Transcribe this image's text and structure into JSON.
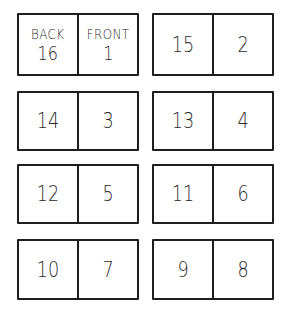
{
  "diagram": {
    "labels": {
      "back": "BACK",
      "front": "FRONT"
    },
    "spreads": [
      {
        "left": "16",
        "right": "1",
        "left_label": "BACK",
        "right_label": "FRONT"
      },
      {
        "left": "15",
        "right": "2"
      },
      {
        "left": "14",
        "right": "3"
      },
      {
        "left": "13",
        "right": "4"
      },
      {
        "left": "12",
        "right": "5"
      },
      {
        "left": "11",
        "right": "6"
      },
      {
        "left": "10",
        "right": "7"
      },
      {
        "left": "9",
        "right": "8"
      }
    ]
  }
}
